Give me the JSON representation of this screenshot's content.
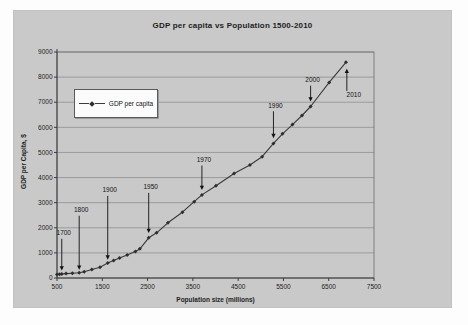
{
  "chart_data": {
    "type": "line",
    "title": "GDP per capita vs Population 1500-2010",
    "xlabel": "Population size (millions)",
    "ylabel": "GDP per Capita, $",
    "xlim": [
      500,
      7500
    ],
    "ylim": [
      0,
      9000
    ],
    "x_ticks": [
      500,
      1500,
      2500,
      3500,
      4500,
      5500,
      6500,
      7500
    ],
    "y_ticks": [
      0,
      1000,
      2000,
      3000,
      4000,
      5000,
      6000,
      7000,
      8000,
      9000
    ],
    "grid": "horizontal",
    "legend": {
      "label": "GDP per capita",
      "position": "inside-upper-left"
    },
    "series": [
      {
        "name": "GDP per capita",
        "marker": "diamond",
        "points": [
          [
            500,
            140
          ],
          [
            555,
            150
          ],
          [
            605,
            160
          ],
          [
            700,
            175
          ],
          [
            840,
            190
          ],
          [
            990,
            210
          ],
          [
            1100,
            250
          ],
          [
            1270,
            340
          ],
          [
            1450,
            430
          ],
          [
            1620,
            600
          ],
          [
            1750,
            700
          ],
          [
            1880,
            800
          ],
          [
            2050,
            920
          ],
          [
            2230,
            1060
          ],
          [
            2330,
            1160
          ],
          [
            2525,
            1600
          ],
          [
            2700,
            1800
          ],
          [
            2950,
            2200
          ],
          [
            3270,
            2620
          ],
          [
            3530,
            3040
          ],
          [
            3700,
            3310
          ],
          [
            4010,
            3670
          ],
          [
            4410,
            4160
          ],
          [
            4760,
            4500
          ],
          [
            5030,
            4830
          ],
          [
            5280,
            5360
          ],
          [
            5480,
            5740
          ],
          [
            5700,
            6110
          ],
          [
            5910,
            6470
          ],
          [
            6100,
            6830
          ],
          [
            6510,
            7790
          ],
          [
            6880,
            8590
          ]
        ]
      }
    ],
    "annotations": [
      {
        "label": "1700",
        "x": 605,
        "from_gdp": 1560,
        "to_gdp": 300,
        "dir": "down",
        "label_dx": 2
      },
      {
        "label": "1800",
        "x": 990,
        "from_gdp": 2480,
        "to_gdp": 330,
        "dir": "down",
        "label_dx": 2
      },
      {
        "label": "1900",
        "x": 1620,
        "from_gdp": 3270,
        "to_gdp": 730,
        "dir": "down",
        "label_dx": 2
      },
      {
        "label": "1950",
        "x": 2525,
        "from_gdp": 3390,
        "to_gdp": 1790,
        "dir": "down",
        "label_dx": 2
      },
      {
        "label": "1970",
        "x": 3700,
        "from_gdp": 4480,
        "to_gdp": 3500,
        "dir": "down",
        "label_dx": 2
      },
      {
        "label": "1990",
        "x": 5280,
        "from_gdp": 6640,
        "to_gdp": 5570,
        "dir": "down",
        "label_dx": 2
      },
      {
        "label": "2000",
        "x": 6100,
        "from_gdp": 7660,
        "to_gdp": 7030,
        "dir": "down",
        "label_dx": 2
      },
      {
        "label": "2010",
        "x": 6900,
        "from_gdp": 7450,
        "to_gdp": 8330,
        "dir": "up",
        "label_dx": 7
      }
    ]
  },
  "colors": {
    "page_bg": "#fdfdfd",
    "chart_bg": "#c9c9c9",
    "grid": "#8f8f8f",
    "plot_border": "#6e6e6e",
    "axis": "#3c3c3c",
    "text": "#1d1d1d",
    "series": "#3a3a3a",
    "marker": "#2e2e2e",
    "annotation": "#111111",
    "legend_bg": "#fbfbfb"
  }
}
